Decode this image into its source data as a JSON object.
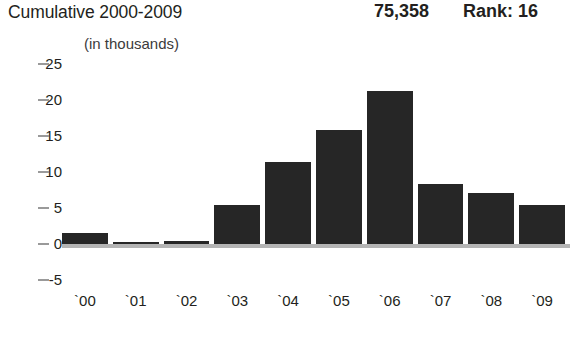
{
  "header": {
    "title": "Cumulative 2000-2009",
    "cumulative_value": "75,358",
    "rank_label": "Rank: 16",
    "subtitle": "(in thousands)"
  },
  "colors": {
    "bar": "#262626",
    "axis_line": "#b4b4b4",
    "tick_mark": "#9a9a9a",
    "text": "#231f20",
    "background": "#ffffff"
  },
  "chart_data": {
    "type": "bar",
    "title": "Cumulative 2000-2009",
    "subtitle": "(in thousands)",
    "xlabel": "",
    "ylabel": "",
    "categories": [
      "`00",
      "`01",
      "`02",
      "`03",
      "`04",
      "`05",
      "`06",
      "`07",
      "`08",
      "`09"
    ],
    "values": [
      1.5,
      0.2,
      0.4,
      5.4,
      11.4,
      15.8,
      21.3,
      8.4,
      7.1,
      5.4
    ],
    "ylim": [
      -5,
      25
    ],
    "ytick_labels": [
      "25",
      "20",
      "15",
      "10",
      "5",
      "0",
      "-5"
    ],
    "ytick_values": [
      25,
      20,
      15,
      10,
      5,
      0,
      -5
    ],
    "grid": false,
    "legend": false,
    "annotations": {
      "cumulative_total": "75,358",
      "rank": "Rank: 16"
    }
  }
}
